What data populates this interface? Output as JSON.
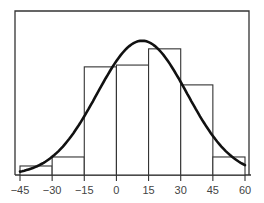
{
  "chart_data": {
    "type": "bar",
    "subtype": "histogram_with_density_curve",
    "title": "",
    "xlabel": "",
    "ylabel": "",
    "bin_edges": [
      -45,
      -30,
      -15,
      0,
      15,
      30,
      45,
      60
    ],
    "categories": [
      "-45 to -30",
      "-30 to -15",
      "-15 to 0",
      "0 to 15",
      "15 to 30",
      "30 to 45",
      "45 to 60"
    ],
    "values": [
      1,
      2,
      12,
      12.2,
      14,
      10,
      2
    ],
    "xticks": [
      "-45",
      "-30",
      "-15",
      "0",
      "15",
      "30",
      "45",
      "60"
    ],
    "xlim": [
      -45,
      60
    ],
    "grid": false,
    "legend": null,
    "series": [
      {
        "name": "histogram",
        "type": "bar",
        "values": [
          1,
          2,
          12,
          12.2,
          14,
          10,
          2
        ]
      },
      {
        "name": "normal density curve",
        "type": "line",
        "x": [
          -45,
          -30,
          -15,
          0,
          10,
          15,
          30,
          45,
          60
        ],
        "y": [
          0,
          2.5,
          8,
          13,
          14.8,
          14.5,
          9.5,
          3.8,
          1
        ]
      }
    ]
  },
  "axis": {
    "tick_labels": [
      "−45",
      "−30",
      "−15",
      "0",
      "15",
      "30",
      "45",
      "60"
    ]
  },
  "colors": {
    "frame": "#333333",
    "bars": "#333333",
    "curve": "#111111",
    "text": "#444444"
  }
}
